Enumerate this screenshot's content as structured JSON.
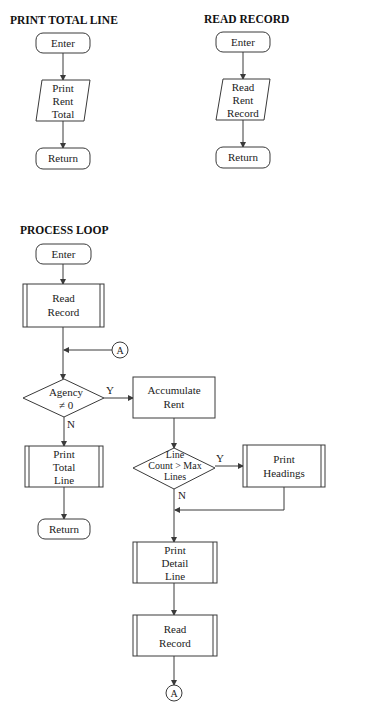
{
  "print_total_line": {
    "title": "PRINT TOTAL LINE",
    "enter": "Enter",
    "io": [
      "Print",
      "Rent",
      "Total"
    ],
    "return": "Return"
  },
  "read_record": {
    "title": "READ RECORD",
    "enter": "Enter",
    "io": [
      "Read",
      "Rent",
      "Record"
    ],
    "return": "Return"
  },
  "process_loop": {
    "title": "PROCESS LOOP",
    "enter": "Enter",
    "read_record_1": [
      "Read",
      "Record"
    ],
    "connector_in": "A",
    "decision_agency": [
      "Agency",
      "≠ 0"
    ],
    "decision_agency_yes": "Y",
    "decision_agency_no": "N",
    "accumulate": [
      "Accumulate",
      "Rent"
    ],
    "print_total": [
      "Print",
      "Total",
      "Line"
    ],
    "return": "Return",
    "decision_lines": [
      "Line",
      "Count > Max",
      "Lines"
    ],
    "decision_lines_yes": "Y",
    "decision_lines_no": "N",
    "print_headings": [
      "Print",
      "Headings"
    ],
    "print_detail": [
      "Print",
      "Detail",
      "Line"
    ],
    "read_record_2": [
      "Read",
      "Record"
    ],
    "connector_out": "A"
  }
}
